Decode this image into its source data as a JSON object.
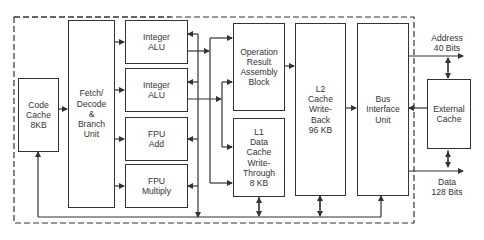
{
  "diagram": {
    "title": "",
    "blocks": {
      "code_cache": "Code\nCache\n8KB",
      "fetch_decode": "Fetch/\nDecode\n&\nBranch\nUnit",
      "integer_alu_1": "Integer\nALU",
      "integer_alu_2": "Integer\nALU",
      "fpu_add": "FPU\nAdd",
      "fpu_multiply": "FPU\nMultiply",
      "operation_result": "Operation\nResult\nAssembly\nBlock",
      "l1_cache": "L1\nData\nCache\nWrite-\nThrough\n8 KB",
      "l2_cache": "L2\nCache\nWrite-\nBack\n96 KB",
      "bus_interface": "Bus\nInterface\nUnit",
      "external_cache": "External\nCache"
    },
    "labels": {
      "address": "Address\n40 Bits",
      "data": "Data\n128 Bits"
    },
    "colors": {
      "line": "#333333",
      "background": "#ffffff"
    }
  }
}
